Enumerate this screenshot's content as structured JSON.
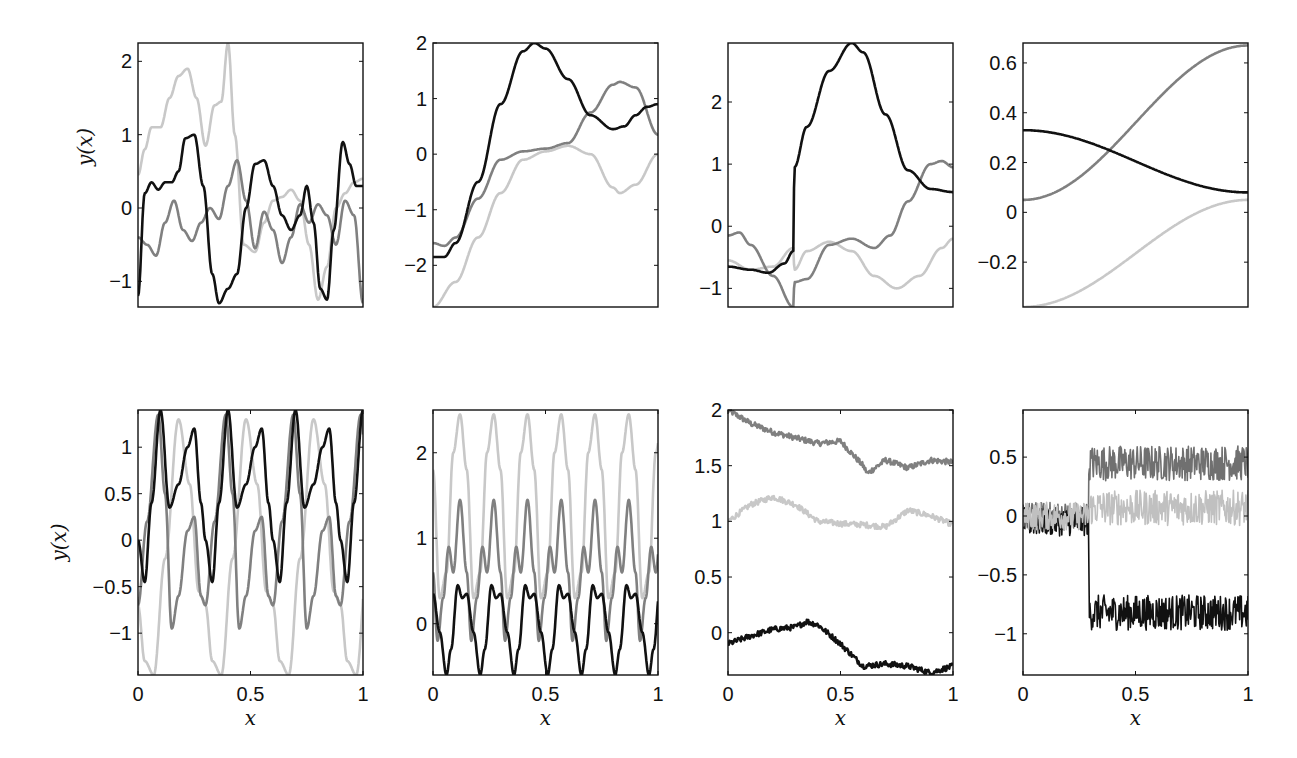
{
  "chart_data": [
    {
      "id": "p1",
      "row": 0,
      "col": 0,
      "type": "line",
      "title": "",
      "xlabel": "",
      "ylabel": "y(x)",
      "xlim": [
        0,
        1
      ],
      "ylim": [
        -1.35,
        2.25
      ],
      "yticks": [
        -1,
        0,
        1,
        2
      ],
      "ytick_labels": [
        "−1",
        "0",
        "1",
        "2"
      ],
      "xticks": [],
      "xtick_labels": [],
      "series": [
        {
          "name": "light",
          "color": "#c8c8c8",
          "x": [
            0,
            0.03,
            0.06,
            0.1,
            0.14,
            0.18,
            0.22,
            0.26,
            0.3,
            0.34,
            0.37,
            0.4,
            0.43,
            0.47,
            0.52,
            0.56,
            0.6,
            0.64,
            0.68,
            0.72,
            0.76,
            0.8,
            0.84,
            0.88,
            0.92,
            0.96,
            1.0
          ],
          "y": [
            0.45,
            0.8,
            1.1,
            1.1,
            1.5,
            1.8,
            1.9,
            1.5,
            0.85,
            1.4,
            1.45,
            2.25,
            1.0,
            -0.5,
            -0.6,
            -0.2,
            0.1,
            0.15,
            0.25,
            0.1,
            -0.5,
            -1.25,
            -0.8,
            0.0,
            0.2,
            0.35,
            0.4
          ]
        },
        {
          "name": "mid",
          "color": "#808080",
          "x": [
            0,
            0.04,
            0.08,
            0.12,
            0.16,
            0.2,
            0.24,
            0.28,
            0.32,
            0.36,
            0.4,
            0.44,
            0.48,
            0.52,
            0.56,
            0.6,
            0.64,
            0.68,
            0.72,
            0.76,
            0.8,
            0.84,
            0.88,
            0.92,
            0.96,
            1.0
          ],
          "y": [
            -0.4,
            -0.5,
            -0.65,
            -0.2,
            0.1,
            -0.3,
            -0.45,
            -0.2,
            0.0,
            -0.15,
            0.3,
            0.65,
            0.1,
            -0.55,
            -0.05,
            -0.3,
            -0.75,
            -0.4,
            0.05,
            -0.2,
            0.05,
            -0.1,
            -0.5,
            0.1,
            -0.1,
            -1.3
          ]
        },
        {
          "name": "dark",
          "color": "#111111",
          "x": [
            0,
            0.03,
            0.06,
            0.09,
            0.12,
            0.15,
            0.18,
            0.21,
            0.25,
            0.29,
            0.33,
            0.36,
            0.4,
            0.44,
            0.48,
            0.52,
            0.56,
            0.6,
            0.64,
            0.68,
            0.72,
            0.75,
            0.78,
            0.81,
            0.84,
            0.87,
            0.91,
            0.94,
            0.97,
            1.0
          ],
          "y": [
            -1.2,
            0.2,
            0.35,
            0.25,
            0.35,
            0.35,
            0.5,
            0.95,
            1.0,
            0.3,
            -0.9,
            -1.3,
            -1.1,
            -0.9,
            0.0,
            0.6,
            0.65,
            0.3,
            -0.1,
            -0.3,
            -0.1,
            0.3,
            -0.2,
            -1.1,
            -1.25,
            -0.3,
            0.9,
            0.6,
            0.3,
            0.3
          ]
        }
      ]
    },
    {
      "id": "p2",
      "row": 0,
      "col": 1,
      "type": "line",
      "title": "",
      "xlabel": "",
      "ylabel": "",
      "xlim": [
        0,
        1
      ],
      "ylim": [
        -2.75,
        2.0
      ],
      "yticks": [
        -2,
        -1,
        0,
        1,
        2
      ],
      "ytick_labels": [
        "−2",
        "−1",
        "0",
        "1",
        "2"
      ],
      "xticks": [],
      "xtick_labels": [],
      "series": [
        {
          "name": "light",
          "color": "#c8c8c8",
          "x": [
            0,
            0.1,
            0.2,
            0.3,
            0.4,
            0.5,
            0.6,
            0.7,
            0.8,
            0.83,
            0.9,
            1.0
          ],
          "y": [
            -2.75,
            -2.3,
            -1.5,
            -0.7,
            -0.1,
            0.05,
            0.15,
            0.0,
            -0.6,
            -0.7,
            -0.55,
            0.0
          ]
        },
        {
          "name": "mid",
          "color": "#808080",
          "x": [
            0,
            0.05,
            0.1,
            0.2,
            0.3,
            0.4,
            0.5,
            0.6,
            0.7,
            0.8,
            0.83,
            0.9,
            1.0
          ],
          "y": [
            -1.6,
            -1.65,
            -1.5,
            -0.8,
            -0.1,
            0.05,
            0.1,
            0.2,
            0.75,
            1.25,
            1.3,
            1.2,
            0.35
          ]
        },
        {
          "name": "dark",
          "color": "#111111",
          "x": [
            0,
            0.05,
            0.1,
            0.2,
            0.3,
            0.4,
            0.45,
            0.5,
            0.6,
            0.7,
            0.8,
            0.85,
            0.9,
            0.95,
            1.0
          ],
          "y": [
            -1.85,
            -1.85,
            -1.6,
            -0.5,
            0.9,
            1.85,
            2.0,
            1.9,
            1.35,
            0.7,
            0.45,
            0.5,
            0.7,
            0.85,
            0.9
          ]
        }
      ]
    },
    {
      "id": "p3",
      "row": 0,
      "col": 2,
      "type": "line",
      "title": "",
      "xlabel": "",
      "ylabel": "",
      "xlim": [
        0,
        1
      ],
      "ylim": [
        -1.3,
        2.95
      ],
      "yticks": [
        -1,
        0,
        1,
        2
      ],
      "ytick_labels": [
        "−1",
        "0",
        "1",
        "2"
      ],
      "xticks": [],
      "xtick_labels": [],
      "series": [
        {
          "name": "light",
          "color": "#c8c8c8",
          "x": [
            0,
            0.1,
            0.2,
            0.29,
            0.295,
            0.35,
            0.45,
            0.55,
            0.65,
            0.75,
            0.85,
            0.95,
            1.0
          ],
          "y": [
            -0.55,
            -0.7,
            -0.65,
            -0.35,
            -0.7,
            -0.4,
            -0.25,
            -0.4,
            -0.8,
            -1.0,
            -0.8,
            -0.35,
            -0.2
          ]
        },
        {
          "name": "mid",
          "color": "#808080",
          "x": [
            0,
            0.05,
            0.1,
            0.2,
            0.29,
            0.295,
            0.35,
            0.45,
            0.55,
            0.65,
            0.72,
            0.8,
            0.9,
            0.95,
            1.0
          ],
          "y": [
            -0.15,
            -0.1,
            -0.3,
            -0.8,
            -1.3,
            -0.9,
            -0.85,
            -0.3,
            -0.2,
            -0.35,
            -0.15,
            0.4,
            1.0,
            1.05,
            0.95
          ]
        },
        {
          "name": "dark",
          "color": "#111111",
          "x": [
            0,
            0.1,
            0.18,
            0.25,
            0.29,
            0.295,
            0.35,
            0.45,
            0.55,
            0.6,
            0.7,
            0.8,
            0.9,
            1.0
          ],
          "y": [
            -0.65,
            -0.7,
            -0.75,
            -0.6,
            -0.4,
            0.95,
            1.6,
            2.5,
            2.95,
            2.8,
            1.8,
            0.9,
            0.6,
            0.55
          ]
        }
      ]
    },
    {
      "id": "p4",
      "row": 0,
      "col": 3,
      "type": "line",
      "title": "",
      "xlabel": "",
      "ylabel": "",
      "xlim": [
        0,
        1
      ],
      "ylim": [
        -0.38,
        0.68
      ],
      "yticks": [
        -0.2,
        0,
        0.2,
        0.4,
        0.6
      ],
      "ytick_labels": [
        "−0.2",
        "0",
        "0.2",
        "0.4",
        "0.6"
      ],
      "xticks": [],
      "xtick_labels": [],
      "series": [
        {
          "name": "light",
          "color": "#c8c8c8",
          "x": [
            0,
            1
          ],
          "y": [
            -0.38,
            0.05
          ]
        },
        {
          "name": "mid",
          "color": "#808080",
          "x": [
            0,
            1
          ],
          "y": [
            0.05,
            0.67
          ]
        },
        {
          "name": "dark",
          "color": "#111111",
          "x": [
            0,
            1
          ],
          "y": [
            0.33,
            0.08
          ]
        }
      ]
    },
    {
      "id": "p5",
      "row": 1,
      "col": 0,
      "type": "line",
      "title": "",
      "xlabel": "x",
      "ylabel": "y(x)",
      "xlim": [
        0,
        1
      ],
      "ylim": [
        -1.45,
        1.4
      ],
      "yticks": [
        -1,
        -0.5,
        0,
        0.5,
        1
      ],
      "ytick_labels": [
        "−1",
        "−0.5",
        "0",
        "0.5",
        "1"
      ],
      "xticks": [
        0,
        0.5,
        1
      ],
      "xtick_labels": [
        "0",
        "0.5",
        "1"
      ],
      "periodic": {
        "period": 0.3
      },
      "series": [
        {
          "name": "light",
          "color": "#c8c8c8",
          "x": [
            0,
            0.03,
            0.07,
            0.12,
            0.18,
            0.23,
            0.27,
            0.3
          ],
          "y": [
            -0.7,
            -1.3,
            -1.45,
            -0.2,
            1.3,
            0.6,
            -0.55,
            -0.7
          ]
        },
        {
          "name": "mid",
          "color": "#808080",
          "x": [
            0,
            0.04,
            0.09,
            0.12,
            0.15,
            0.18,
            0.22,
            0.25,
            0.28,
            0.3
          ],
          "y": [
            -0.7,
            0.2,
            1.35,
            0.5,
            -0.95,
            -0.6,
            0.1,
            0.25,
            -0.6,
            -0.7
          ]
        },
        {
          "name": "dark",
          "color": "#111111",
          "x": [
            0,
            0.03,
            0.06,
            0.1,
            0.14,
            0.18,
            0.22,
            0.25,
            0.28,
            0.3
          ],
          "y": [
            0.0,
            -0.45,
            0.4,
            1.4,
            0.35,
            0.6,
            1.0,
            1.2,
            0.4,
            0.0
          ]
        }
      ]
    },
    {
      "id": "p6",
      "row": 1,
      "col": 1,
      "type": "line",
      "title": "",
      "xlabel": "x",
      "ylabel": "",
      "xlim": [
        0,
        1
      ],
      "ylim": [
        -0.6,
        2.5
      ],
      "yticks": [
        0,
        1,
        2
      ],
      "ytick_labels": [
        "0",
        "1",
        "2"
      ],
      "xticks": [
        0,
        0.5,
        1
      ],
      "xtick_labels": [
        "0",
        "0.5",
        "1"
      ],
      "periodic": {
        "period": 0.15
      },
      "series": [
        {
          "name": "light",
          "color": "#c8c8c8",
          "x": [
            0,
            0.03,
            0.06,
            0.09,
            0.12,
            0.15
          ],
          "y": [
            1.8,
            0.3,
            0.6,
            2.0,
            2.45,
            1.8
          ]
        },
        {
          "name": "mid",
          "color": "#808080",
          "x": [
            0,
            0.02,
            0.045,
            0.07,
            0.09,
            0.12,
            0.15
          ],
          "y": [
            0.6,
            -0.2,
            0.3,
            0.9,
            0.6,
            1.45,
            0.6
          ]
        },
        {
          "name": "dark",
          "color": "#111111",
          "x": [
            0,
            0.03,
            0.06,
            0.08,
            0.11,
            0.13,
            0.15
          ],
          "y": [
            0.35,
            -0.1,
            -0.6,
            -0.3,
            0.45,
            0.3,
            0.35
          ]
        }
      ]
    },
    {
      "id": "p7",
      "row": 1,
      "col": 2,
      "type": "line",
      "title": "",
      "xlabel": "x",
      "ylabel": "",
      "xlim": [
        0,
        1
      ],
      "ylim": [
        -0.38,
        2.0
      ],
      "yticks": [
        0,
        0.5,
        1,
        1.5,
        2
      ],
      "ytick_labels": [
        "0",
        "0.5",
        "1",
        "1.5",
        "2"
      ],
      "xticks": [
        0,
        0.5,
        1
      ],
      "xtick_labels": [
        "0",
        "0.5",
        "1"
      ],
      "noise": {
        "amplitude": 0.025
      },
      "series": [
        {
          "name": "mid",
          "color": "#808080",
          "x": [
            0,
            0.1,
            0.2,
            0.3,
            0.4,
            0.5,
            0.6,
            0.62,
            0.7,
            0.8,
            0.9,
            1.0
          ],
          "y": [
            2.0,
            1.88,
            1.8,
            1.75,
            1.7,
            1.72,
            1.5,
            1.43,
            1.55,
            1.48,
            1.55,
            1.53
          ]
        },
        {
          "name": "light",
          "color": "#c8c8c8",
          "x": [
            0,
            0.1,
            0.2,
            0.3,
            0.4,
            0.5,
            0.6,
            0.7,
            0.8,
            0.9,
            1.0
          ],
          "y": [
            1.0,
            1.15,
            1.22,
            1.15,
            1.0,
            0.98,
            0.97,
            0.95,
            1.1,
            1.05,
            0.97
          ]
        },
        {
          "name": "dark",
          "color": "#111111",
          "x": [
            0,
            0.1,
            0.2,
            0.3,
            0.35,
            0.4,
            0.5,
            0.6,
            0.7,
            0.8,
            0.9,
            1.0
          ],
          "y": [
            -0.1,
            -0.03,
            0.03,
            0.05,
            0.1,
            0.07,
            -0.1,
            -0.3,
            -0.28,
            -0.3,
            -0.36,
            -0.3
          ]
        }
      ]
    },
    {
      "id": "p8",
      "row": 1,
      "col": 3,
      "type": "line",
      "title": "",
      "xlabel": "x",
      "ylabel": "",
      "xlim": [
        0,
        1
      ],
      "ylim": [
        -1.35,
        0.9
      ],
      "yticks": [
        -1,
        -0.5,
        0,
        0.5
      ],
      "ytick_labels": [
        "−1",
        "−0.5",
        "0",
        "0.5"
      ],
      "xticks": [
        0,
        0.5,
        1
      ],
      "xtick_labels": [
        "0",
        "0.5",
        "1"
      ],
      "noise": {
        "amplitude": 0.15,
        "samples": 400
      },
      "series": [
        {
          "name": "mid",
          "color": "#707070",
          "x": [
            0,
            0.29,
            0.295,
            1.0
          ],
          "y": [
            0.0,
            0.0,
            0.45,
            0.45
          ]
        },
        {
          "name": "dark",
          "color": "#111111",
          "x": [
            0,
            0.29,
            0.295,
            1.0
          ],
          "y": [
            -0.05,
            -0.05,
            -0.82,
            -0.82
          ]
        },
        {
          "name": "light",
          "color": "#c0c0c0",
          "x": [
            0,
            0.29,
            0.295,
            1.0
          ],
          "y": [
            0.0,
            0.0,
            0.07,
            0.07
          ]
        }
      ]
    }
  ],
  "layout": {
    "columns_x": [
      138,
      433,
      728,
      1023
    ],
    "panel_width": 225,
    "rows_y": [
      43,
      410
    ],
    "panel_height": [
      264,
      265
    ]
  }
}
